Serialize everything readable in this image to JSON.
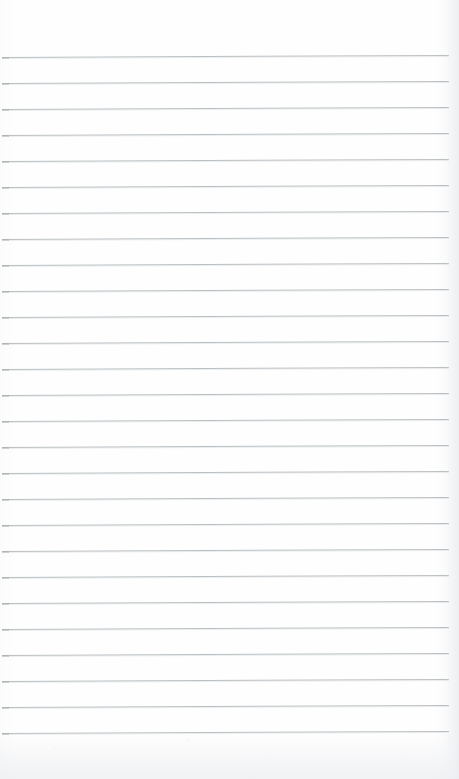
{
  "document": {
    "kind": "scanned-lined-notepad-page",
    "title": "Blank ruled notepad page",
    "content_text": "",
    "page_width": 459,
    "page_height": 779,
    "paper_color": "#fdfdfd",
    "rule_color": "#b5babe",
    "margin_rule": "none",
    "handwriting_present": "no",
    "text_blocks": [],
    "ruling": {
      "line_count": 27,
      "first_line_y": 57,
      "line_spacing": 26.0,
      "line_start_x": 2,
      "line_end_x": 449,
      "line_thickness": 1,
      "slant_rise_px": -2,
      "top_margin": 57,
      "bottom_margin": 45
    }
  }
}
